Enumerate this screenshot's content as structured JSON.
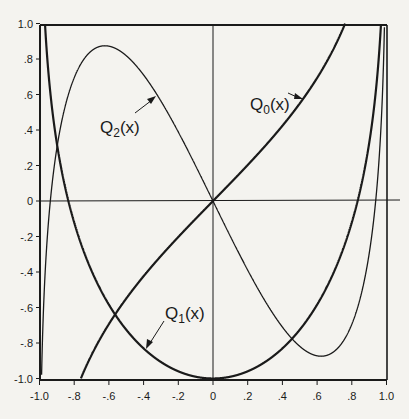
{
  "chart_data": {
    "type": "line",
    "title": "",
    "xlabel": "x",
    "ylabel": "",
    "xlim": [
      -1.0,
      1.0
    ],
    "ylim": [
      -1.0,
      1.0
    ],
    "grid": false,
    "legend": "inline labels with arrows",
    "x_ticks": [
      "-1.0",
      "-.8",
      "-.6",
      "-.4",
      "-.2",
      "0",
      ".2",
      ".4",
      ".6",
      ".8",
      "1.0"
    ],
    "y_ticks": [
      "1.0",
      ".8",
      ".6",
      ".4",
      ".2",
      "0",
      "-.2",
      "-.4",
      "-.6",
      "-.8",
      "-1.0"
    ],
    "series": [
      {
        "name": "Q0(x)",
        "label_main": "Q",
        "label_sub": "0",
        "label_tail": "(x)",
        "stroke_width": 2.2,
        "x": [
          -0.76,
          -0.6,
          -0.4,
          -0.2,
          0,
          0.2,
          0.4,
          0.6,
          0.76
        ],
        "values": [
          -1.0,
          -0.69,
          -0.42,
          -0.2,
          0,
          0.2,
          0.42,
          0.69,
          1.0
        ]
      },
      {
        "name": "Q1(x)",
        "label_main": "Q",
        "label_sub": "1",
        "label_tail": "(x)",
        "stroke_width": 2.2,
        "x": [
          -0.99,
          -0.9,
          -0.8,
          -0.6,
          -0.4,
          -0.2,
          0,
          0.2,
          0.4,
          0.6,
          0.8,
          0.9,
          0.99
        ],
        "values": [
          1.0,
          0.33,
          -0.12,
          -0.58,
          -0.83,
          -0.96,
          -1.0,
          -0.96,
          -0.83,
          -0.58,
          -0.12,
          0.33,
          1.0
        ]
      },
      {
        "name": "Q2(x)",
        "label_main": "Q",
        "label_sub": "2",
        "label_tail": "(x)",
        "stroke_width": 1.3,
        "x": [
          -0.99,
          -0.95,
          -0.9,
          -0.8,
          -0.65,
          -0.4,
          -0.2,
          0,
          0.2,
          0.4,
          0.65,
          0.8,
          0.9,
          0.95,
          0.99
        ],
        "values": [
          -1.0,
          -0.05,
          0.44,
          0.81,
          0.87,
          0.62,
          0.29,
          0,
          -0.29,
          -0.62,
          -0.87,
          -0.81,
          -0.44,
          0.05,
          1.0
        ]
      }
    ],
    "annotations": [
      {
        "text": "Q0(x)",
        "points_to": [
          0.49,
          0.53
        ]
      },
      {
        "text": "Q1(x)",
        "points_to": [
          -0.43,
          -0.81
        ]
      },
      {
        "text": "Q2(x)",
        "points_to": [
          -0.45,
          0.68
        ]
      }
    ]
  },
  "labels": {
    "q0": {
      "main": "Q",
      "sub": "0",
      "tail": "(x)"
    },
    "q1": {
      "main": "Q",
      "sub": "1",
      "tail": "(x)"
    },
    "q2": {
      "main": "Q",
      "sub": "2",
      "tail": "(x)"
    }
  }
}
